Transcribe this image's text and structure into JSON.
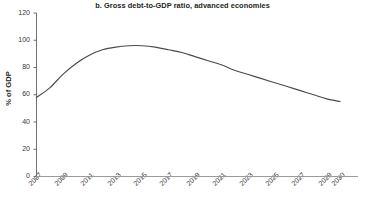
{
  "chart_data": {
    "type": "line",
    "title": "b. Gross debt-to-GDP ratio, advanced economies",
    "xlabel": "",
    "ylabel": "% of GDP",
    "grid": false,
    "legend": "none",
    "xlim": [
      2007,
      2030
    ],
    "ylim": [
      0,
      120
    ],
    "yticks": [
      0,
      20,
      40,
      60,
      80,
      100,
      120
    ],
    "xticks": [
      2007,
      2009,
      2011,
      2013,
      2015,
      2017,
      2019,
      2021,
      2023,
      2025,
      2027,
      2029,
      2030
    ],
    "x": [
      2007,
      2008,
      2009,
      2010,
      2011,
      2012,
      2013,
      2014,
      2015,
      2016,
      2017,
      2018,
      2019,
      2020,
      2021,
      2022,
      2023,
      2024,
      2025,
      2026,
      2027,
      2028,
      2029,
      2030
    ],
    "series": [
      {
        "name": "Gross debt-to-GDP ratio, advanced economies",
        "color": "#4b4b4b",
        "values": [
          58,
          65,
          75,
          83,
          89,
          93,
          95,
          96,
          96,
          95,
          93,
          91,
          88,
          85,
          82,
          78,
          75,
          72,
          69,
          66,
          63,
          60,
          57,
          55
        ]
      }
    ]
  },
  "axis": {
    "y_tick_labels": [
      "120",
      "100",
      "80",
      "60",
      "40",
      "20",
      "0"
    ],
    "x_tick_labels": [
      "2007",
      "2009",
      "2011",
      "2013",
      "2015",
      "2017",
      "2019",
      "2021",
      "2023",
      "2025",
      "2027",
      "2029",
      "2030"
    ],
    "y_axis_title": "% of GDP"
  },
  "style": {
    "line_color": "#4b4b4b",
    "axis_color": "#6f6f6f",
    "text_color": "#231f20"
  }
}
